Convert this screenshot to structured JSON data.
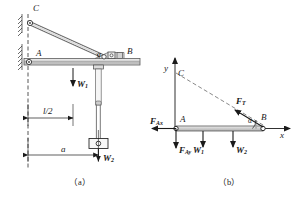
{
  "figure": {
    "title_a": "（a）",
    "title_b": "（b）",
    "panel_a": {
      "points": {
        "C": "C",
        "A": "A",
        "B": "B"
      },
      "angle_label": "α",
      "loads": [
        {
          "name": "W1",
          "base": "W",
          "sub": "1"
        },
        {
          "name": "W2",
          "base": "W",
          "sub": "2"
        }
      ],
      "dimensions": [
        {
          "name": "half-span",
          "text": "l/2"
        },
        {
          "name": "trolley-distance",
          "text": "a"
        }
      ]
    },
    "panel_b": {
      "axes": {
        "x": "x",
        "y": "y"
      },
      "points": {
        "C": "C",
        "A": "A",
        "B": "B"
      },
      "angle_label": "α",
      "forces": [
        {
          "name": "FAx",
          "base": "F",
          "sub": "Ax"
        },
        {
          "name": "FAy",
          "base": "F",
          "sub": "Ay"
        },
        {
          "name": "FT",
          "base": "F",
          "sub": "T"
        },
        {
          "name": "W1",
          "base": "W",
          "sub": "1"
        },
        {
          "name": "W2",
          "base": "W",
          "sub": "2"
        }
      ]
    }
  }
}
